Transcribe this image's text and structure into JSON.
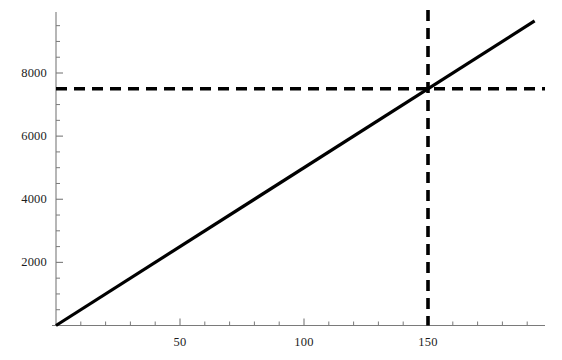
{
  "chart_data": {
    "type": "line",
    "title": "",
    "xlabel": "",
    "ylabel": "",
    "xlim": [
      0,
      193
    ],
    "ylim": [
      0,
      9700
    ],
    "grid": false,
    "legend": null,
    "series": [
      {
        "name": "line",
        "style": "solid",
        "color": "#000000",
        "points": [
          {
            "x": 0,
            "y": 0
          },
          {
            "x": 193,
            "y": 9650
          }
        ],
        "slope": 50,
        "intercept": 0
      }
    ],
    "annotations": [
      {
        "name": "horizontal-reference",
        "type": "hline",
        "style": "dashed",
        "color": "#000000",
        "y": 7500
      },
      {
        "name": "vertical-reference",
        "type": "vline",
        "style": "dashed",
        "color": "#000000",
        "x": 150
      },
      {
        "name": "intersection",
        "type": "point",
        "x": 150,
        "y": 7500
      }
    ],
    "x_ticks_major": [
      50,
      100,
      150
    ],
    "x_tick_labels": [
      "50",
      "100",
      "150"
    ],
    "x_ticks_minor_step": 10,
    "y_ticks_major": [
      2000,
      4000,
      6000,
      8000
    ],
    "y_tick_labels": [
      "2000",
      "4000",
      "6000",
      "8000"
    ],
    "y_ticks_minor_step": 500
  },
  "axes": {
    "x_axis_name": "x-axis",
    "y_axis_name": "y-axis"
  }
}
